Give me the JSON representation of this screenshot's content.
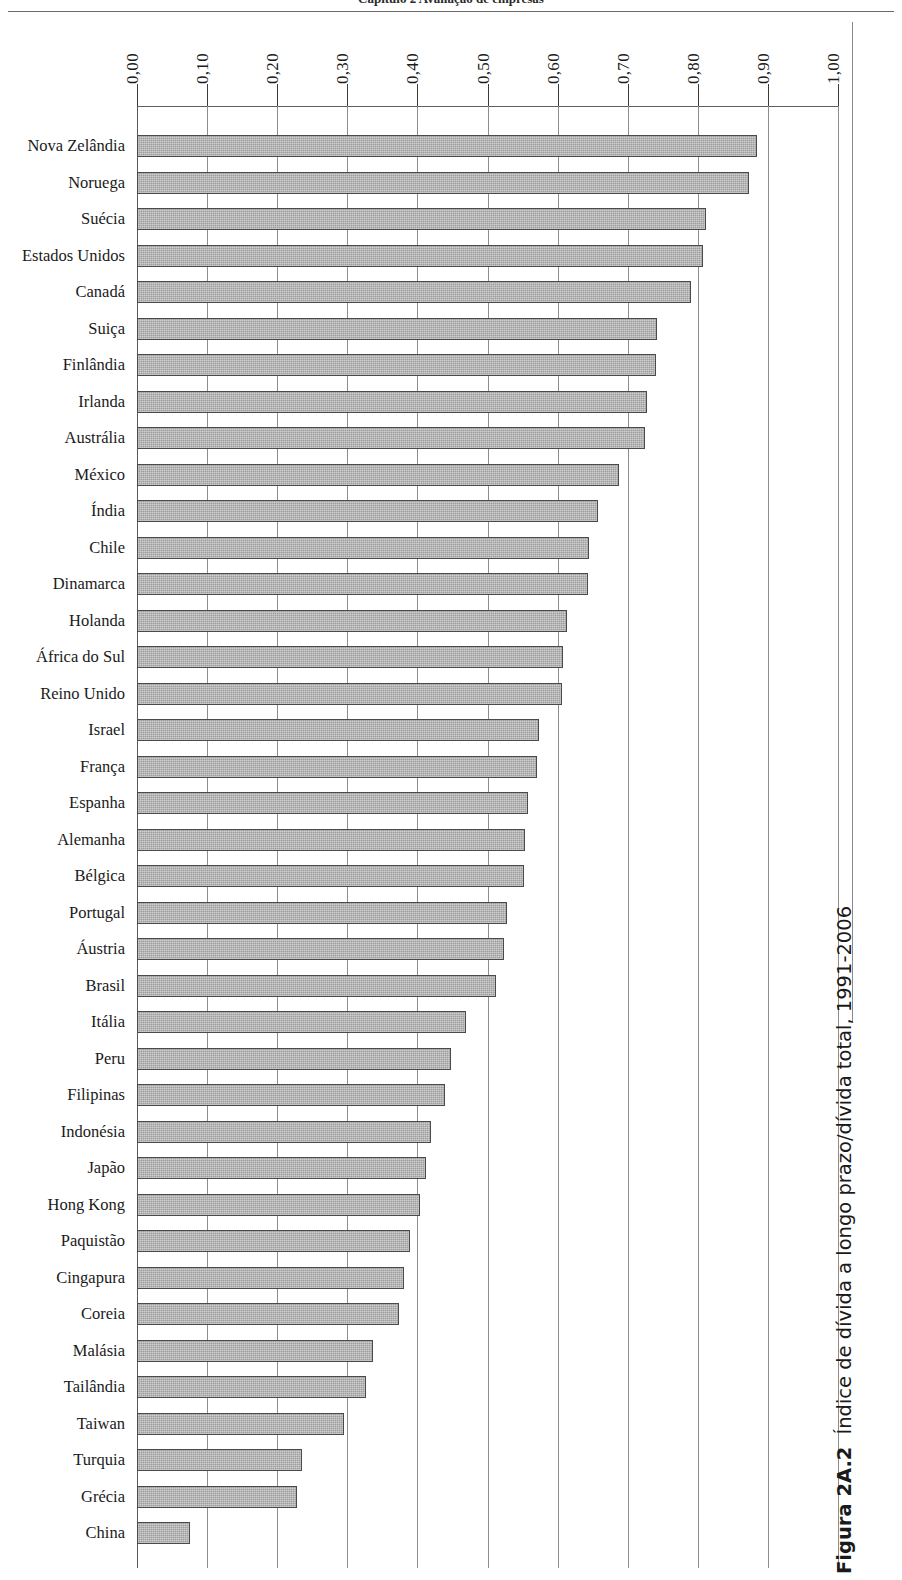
{
  "header": {
    "running_head": "Capítulo 2    Avaliação de  empresas"
  },
  "caption": {
    "figure_number": "Figura 2A.2",
    "text": "Índice de dívida a longo prazo/dívida total, 1991-2006"
  },
  "axis": {
    "tick_labels": [
      "0,00",
      "0,10",
      "0,20",
      "0,30",
      "0,40",
      "0,50",
      "0,60",
      "0,70",
      "0,80",
      "0,90",
      "1,00"
    ],
    "position": "top",
    "label_rotation": "-90deg"
  },
  "colors": {
    "bar_fill": "#9d9d9d",
    "bar_border": "#4a4a4a",
    "gridline": "#8d8d8d",
    "text": "#1a1a1a"
  },
  "chart_data": {
    "type": "bar",
    "orientation": "horizontal",
    "title": "Índice de dívida a longo prazo/dívida total, 1991-2006",
    "xlabel": "",
    "ylabel": "",
    "xlim": [
      0.0,
      1.0
    ],
    "xticks": [
      0.0,
      0.1,
      0.2,
      0.3,
      0.4,
      0.5,
      0.6,
      0.7,
      0.8,
      0.9,
      1.0
    ],
    "grid": true,
    "legend": null,
    "decimal_separator": ",",
    "categories": [
      "Nova Zelândia",
      "Noruega",
      "Suécia",
      "Estados Unidos",
      "Canadá",
      "Suiça",
      "Finlândia",
      "Irlanda",
      "Austrália",
      "México",
      "Índia",
      "Chile",
      "Dinamarca",
      "Holanda",
      "África do Sul",
      "Reino Unido",
      "Israel",
      "França",
      "Espanha",
      "Alemanha",
      "Bélgica",
      "Portugal",
      "Áustria",
      "Brasil",
      "Itália",
      "Peru",
      "Filipinas",
      "Indonésia",
      "Japão",
      "Hong Kong",
      "Paquistão",
      "Cingapura",
      "Coreia",
      "Malásia",
      "Tailândia",
      "Taiwan",
      "Turquia",
      "Grécia",
      "China"
    ],
    "values": [
      0.885,
      0.873,
      0.812,
      0.808,
      0.79,
      0.742,
      0.74,
      0.727,
      0.724,
      0.688,
      0.657,
      0.645,
      0.643,
      0.614,
      0.607,
      0.606,
      0.573,
      0.57,
      0.558,
      0.553,
      0.552,
      0.528,
      0.524,
      0.512,
      0.47,
      0.448,
      0.44,
      0.42,
      0.412,
      0.404,
      0.389,
      0.381,
      0.374,
      0.337,
      0.327,
      0.295,
      0.235,
      0.228,
      0.075
    ]
  }
}
